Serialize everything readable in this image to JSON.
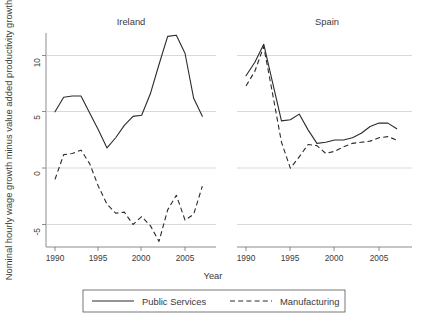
{
  "chart_data": {
    "type": "line",
    "title": "",
    "xlabel": "Year",
    "ylabel": "Nominal hourly wage growth minus value added productivity growth",
    "ylim": [
      -8,
      13
    ],
    "xlim": [
      1989,
      2008
    ],
    "grid": true,
    "yticks": [
      -5,
      0,
      5,
      10
    ],
    "ytick_labels": [
      "-5",
      "0",
      "5",
      "10"
    ],
    "xticks": [
      1990,
      1995,
      2000,
      2005
    ],
    "xtick_labels": [
      "1990",
      "1995",
      "2000",
      "2005"
    ],
    "legend_position": "bottom",
    "legend": [
      "Public Services",
      "Manufacturing"
    ],
    "panels": [
      {
        "name": "Ireland",
        "x": [
          1990,
          1991,
          1992,
          1993,
          1994,
          1995,
          1996,
          1997,
          1998,
          1999,
          2000,
          2001,
          2002,
          2003,
          2004,
          2005,
          2006,
          2007
        ],
        "series": [
          {
            "name": "Public Services",
            "style": "solid",
            "values": [
              5.0,
              6.3,
              6.4,
              6.4,
              4.9,
              3.4,
              1.8,
              2.7,
              3.8,
              4.6,
              4.7,
              6.6,
              9.2,
              11.7,
              11.8,
              10.2,
              6.2,
              4.6
            ]
          },
          {
            "name": "Manufacturing",
            "style": "dashed",
            "values": [
              -1.0,
              1.2,
              1.3,
              1.6,
              0.4,
              -1.6,
              -3.2,
              -4.0,
              -3.9,
              -5.0,
              -4.3,
              -5.1,
              -6.5,
              -3.7,
              -2.4,
              -4.6,
              -4.1,
              -1.6
            ]
          }
        ]
      },
      {
        "name": "Spain",
        "x": [
          1990,
          1991,
          1992,
          1993,
          1994,
          1995,
          1996,
          1997,
          1998,
          1999,
          2000,
          2001,
          2002,
          2003,
          2004,
          2005,
          2006,
          2007
        ],
        "series": [
          {
            "name": "Public Services",
            "style": "solid",
            "values": [
              8.2,
              9.4,
              11.0,
              7.6,
              4.2,
              4.3,
              4.8,
              3.4,
              2.2,
              2.3,
              2.5,
              2.5,
              2.7,
              3.1,
              3.7,
              4.0,
              4.0,
              3.5
            ]
          },
          {
            "name": "Manufacturing",
            "style": "dashed",
            "values": [
              7.3,
              8.6,
              10.8,
              6.6,
              2.3,
              0.0,
              1.0,
              2.1,
              2.0,
              1.3,
              1.5,
              1.9,
              2.2,
              2.3,
              2.4,
              2.7,
              2.8,
              2.5
            ]
          }
        ]
      }
    ]
  },
  "axes": {
    "ylabel": "Nominal hourly wage growth minus value added productivity growth",
    "xlabel": "Year",
    "ytick_labels": [
      "10",
      "5",
      "0",
      "-5"
    ],
    "xtick_labels_left": [
      "1990",
      "1995",
      "2000",
      "2005"
    ],
    "xtick_labels_right": [
      "1990",
      "1995",
      "2000",
      "2005"
    ]
  },
  "panels": {
    "left_title": "Ireland",
    "right_title": "Spain"
  },
  "legend": {
    "solid_label": "Public Services",
    "dashed_label": "Manufacturing"
  },
  "colors": {
    "line": "#2b2b2b",
    "grid": "#c8c8c8",
    "axis": "#6f6f6f",
    "background": "#ffffff",
    "text": "#3a3a3a"
  }
}
